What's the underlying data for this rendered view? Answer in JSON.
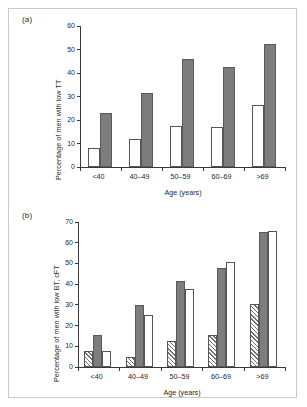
{
  "figure": {
    "panels": [
      {
        "tag": "(a)",
        "ylabel": "Percentage of men with low TT",
        "xlabel": "Age (years)"
      },
      {
        "tag": "(b)",
        "ylabel": "Percentage of men with low BT, cFT",
        "xlabel": "Age (years)"
      }
    ]
  },
  "chart_data": [
    {
      "type": "bar",
      "title": "",
      "panel": "(a)",
      "categories": [
        "<40",
        "40–49",
        "50–59",
        "60–69",
        ">69"
      ],
      "series": [
        {
          "name": "open",
          "fill": "white",
          "values": [
            8,
            12,
            17.5,
            17,
            26.5
          ]
        },
        {
          "name": "solid",
          "fill": "gray",
          "values": [
            23,
            31.5,
            46,
            42.5,
            52.5
          ]
        }
      ],
      "xlabel": "Age (years)",
      "ylabel": "Percentage of men with low TT",
      "ylim": [
        0,
        60
      ],
      "yticks": [
        0,
        10,
        20,
        30,
        40,
        50,
        60
      ],
      "grid": false,
      "legend": "none"
    },
    {
      "type": "bar",
      "title": "",
      "panel": "(b)",
      "categories": [
        "<40",
        "40–49",
        "50–59",
        "60–69",
        ">69"
      ],
      "series": [
        {
          "name": "hatched",
          "fill": "hatch",
          "values": [
            7.5,
            5,
            12.5,
            15.5,
            30.5
          ]
        },
        {
          "name": "solid",
          "fill": "gray",
          "values": [
            15.5,
            30,
            41.5,
            48,
            65
          ]
        },
        {
          "name": "open",
          "fill": "white",
          "values": [
            7.5,
            25,
            37.5,
            50.5,
            65.5
          ]
        }
      ],
      "xlabel": "Age (years)",
      "ylabel": "Percentage of men with low BT, cFT",
      "ylim": [
        0,
        70
      ],
      "yticks": [
        0,
        10,
        20,
        30,
        40,
        50,
        60,
        70
      ],
      "grid": false,
      "legend": "none"
    }
  ],
  "colors": {
    "solid_fill": "#7d7d7d",
    "open_fill": "#ffffff",
    "hatch_stroke": "#6f6f6f",
    "axis": "#3a3a3a",
    "frame": "#c9c9c9"
  }
}
